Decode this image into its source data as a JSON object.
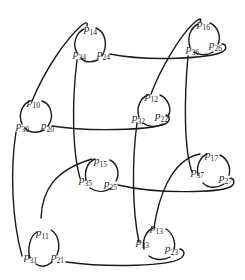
{
  "diagram": {
    "stroke_color": "#1a1a1a",
    "text_color": "#222222",
    "nodes": [
      {
        "id": "n0",
        "labels": {
          "top": {
            "base": "p",
            "sub": "10"
          },
          "left": {
            "base": "p",
            "sub": "30"
          },
          "right": {
            "base": "p",
            "sub": "20"
          }
        }
      },
      {
        "id": "n1",
        "labels": {
          "top": {
            "base": "p",
            "sub": "11"
          },
          "left": {
            "base": "p",
            "sub": "31"
          },
          "right": {
            "base": "p",
            "sub": "21"
          }
        }
      },
      {
        "id": "n2",
        "labels": {
          "top": {
            "base": "p",
            "sub": "12"
          },
          "left": {
            "base": "p",
            "sub": "32"
          },
          "right": {
            "base": "p",
            "sub": "22"
          }
        }
      },
      {
        "id": "n3",
        "labels": {
          "top": {
            "base": "p",
            "sub": "13"
          },
          "left": {
            "base": "p",
            "sub": "33"
          },
          "right": {
            "base": "p",
            "sub": "23"
          }
        }
      },
      {
        "id": "n4",
        "labels": {
          "top": {
            "base": "p",
            "sub": "14"
          },
          "left": {
            "base": "p",
            "sub": "34"
          },
          "right": {
            "base": "p",
            "sub": "24"
          }
        }
      },
      {
        "id": "n5",
        "labels": {
          "top": {
            "base": "p",
            "sub": "15"
          },
          "left": {
            "base": "p",
            "sub": "35"
          },
          "right": {
            "base": "p",
            "sub": "25"
          }
        }
      },
      {
        "id": "n6",
        "labels": {
          "top": {
            "base": "p",
            "sub": "16"
          },
          "left": {
            "base": "p",
            "sub": "36"
          },
          "right": {
            "base": "p",
            "sub": "26"
          }
        }
      },
      {
        "id": "n7",
        "labels": {
          "top": {
            "base": "p",
            "sub": "17"
          },
          "left": {
            "base": "p",
            "sub": "37"
          },
          "right": {
            "base": "p",
            "sub": "27"
          }
        }
      }
    ]
  }
}
